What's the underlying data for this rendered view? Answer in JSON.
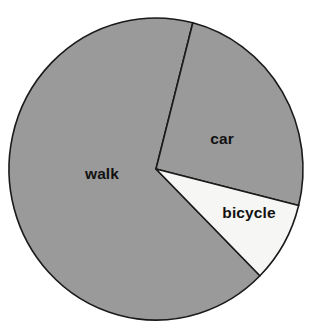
{
  "chart_data": {
    "type": "pie",
    "title": "",
    "subtitle": "",
    "xlabel": "",
    "ylabel": "",
    "legend_position": "none",
    "grid": false,
    "labels_inside_slices": true,
    "categories": [
      "walk",
      "car",
      "bicycle"
    ],
    "values": [
      66.5,
      24.8,
      8.7
    ],
    "units": "percent",
    "start_angle_deg_from_12_oclock": 14.5,
    "direction": "clockwise",
    "slices": [
      {
        "label": "walk",
        "value": 66.5,
        "angle_deg": 239.5,
        "color": "#9a9a9a",
        "start_deg": 135.0,
        "end_deg": 374.5,
        "label_x": 102,
        "label_y": 179
      },
      {
        "label": "car",
        "value": 24.8,
        "angle_deg": 89.5,
        "color": "#9a9a9a",
        "start_deg": 14.5,
        "end_deg": 104.0,
        "label_x": 222,
        "label_y": 144
      },
      {
        "label": "bicycle",
        "value": 8.7,
        "angle_deg": 31.0,
        "color": "#f6f6f4",
        "start_deg": 104.0,
        "end_deg": 135.0,
        "label_x": 249,
        "label_y": 218
      }
    ]
  },
  "figure": {
    "background_color": "#ffffff",
    "outline_color": "#1a1a1a",
    "center_x": 156,
    "center_y": 169,
    "radius_x": 147,
    "radius_y": 151
  }
}
